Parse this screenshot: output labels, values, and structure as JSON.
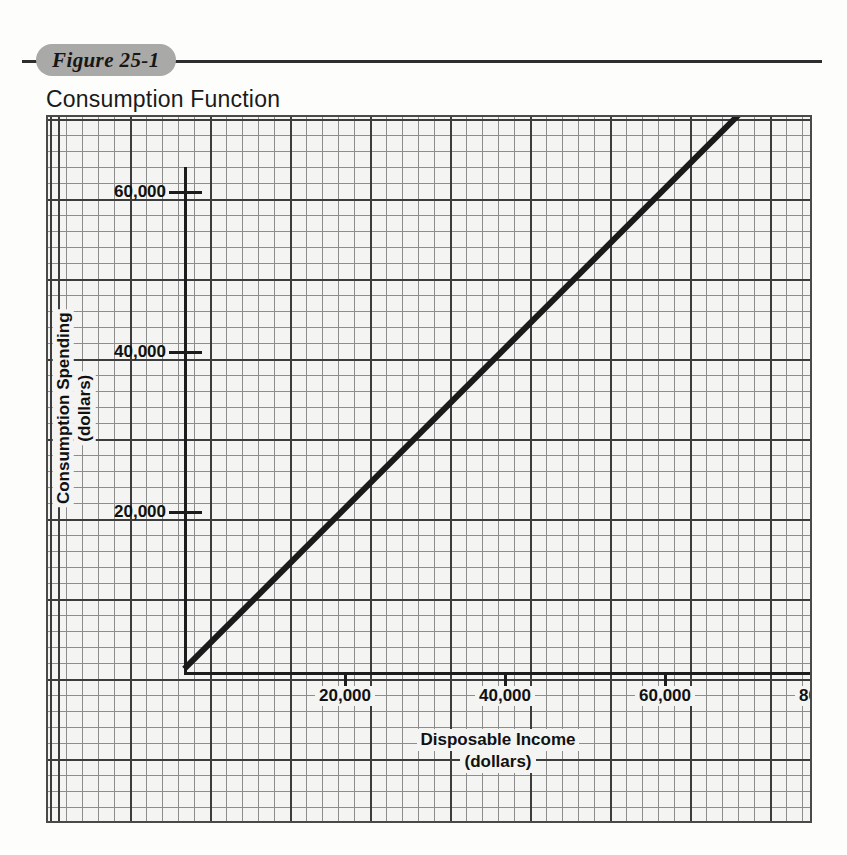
{
  "figure": {
    "badge_label": "Figure 25-1",
    "title": "Consumption Function"
  },
  "ghost_text": {
    "line1": "",
    "line2": ""
  },
  "chart_data": {
    "type": "line",
    "title": "Consumption Function",
    "xlabel": "Disposable Income",
    "xlabel_units": "(dollars)",
    "ylabel": "Consumption Spending",
    "ylabel_units": "(dollars)",
    "xlim": [
      0,
      120000
    ],
    "ylim": [
      0,
      120000
    ],
    "grid": true,
    "grid_style": "graph-paper",
    "legend_position": "inline-annotation",
    "x_ticks": [
      {
        "value": 20000,
        "label": "20,000"
      },
      {
        "value": 40000,
        "label": "40,000"
      },
      {
        "value": 60000,
        "label": "60,000"
      },
      {
        "value": 80000,
        "label": "80,000"
      },
      {
        "value": 100000,
        "label": "100,000"
      }
    ],
    "y_ticks": [
      {
        "value": 20000,
        "label": "20,000"
      },
      {
        "value": 40000,
        "label": "40,000"
      },
      {
        "value": 60000,
        "label": "60,000"
      },
      {
        "value": 80000,
        "label": "80,000"
      },
      {
        "value": 100000,
        "label": "100,000"
      }
    ],
    "series": [
      {
        "name": "45° Line",
        "annotation": "45° Line",
        "slope": 1,
        "intercept": 0,
        "x": [
          0,
          100000
        ],
        "values": [
          0,
          100000
        ]
      }
    ],
    "colors": {
      "line": "#1a1a1a",
      "grid_minor": "#8d8d8d",
      "grid_major": "#3c3c3c",
      "paper": "#f4f4f2",
      "badge": "#a9a9a7"
    }
  }
}
